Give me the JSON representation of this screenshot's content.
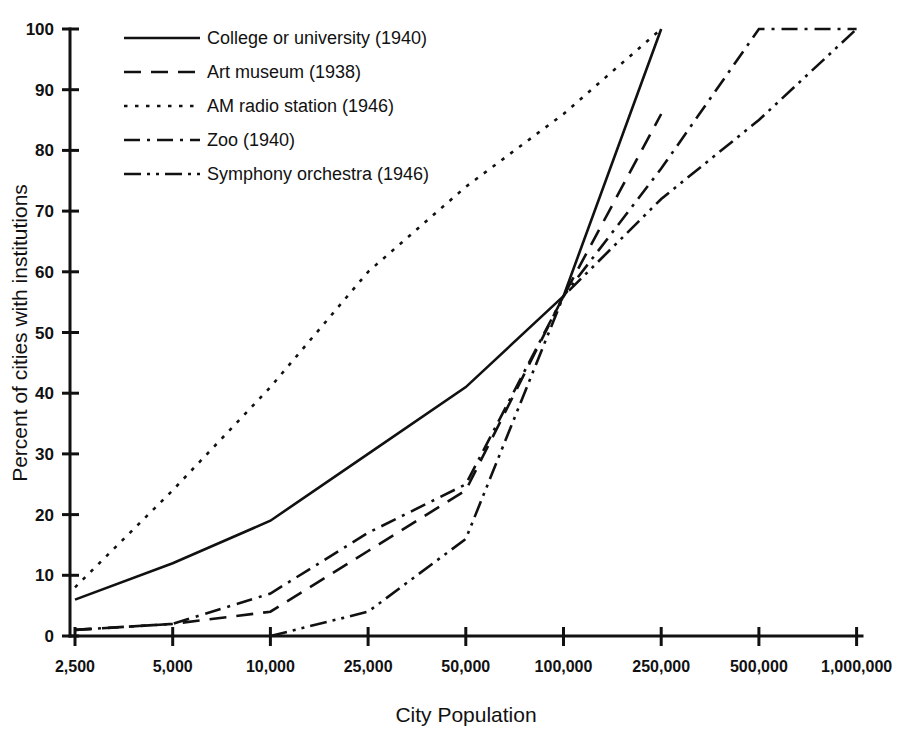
{
  "chart_data": {
    "type": "line",
    "title": "",
    "xlabel": "City Population",
    "ylabel": "Percent of cities with institutions",
    "categories": [
      "2,500",
      "5,000",
      "10,000",
      "25,000",
      "50,000",
      "100,000",
      "250,000",
      "500,000",
      "1,000,000"
    ],
    "x_tick_labels": [
      "2,500",
      "5,000",
      "10,000",
      "25,000",
      "50,000",
      "100,000",
      "250,000",
      "500,000",
      "1,000,000"
    ],
    "y_tick_labels": [
      "0",
      "10",
      "20",
      "30",
      "40",
      "50",
      "60",
      "70",
      "80",
      "90",
      "100"
    ],
    "ylim": [
      0,
      100
    ],
    "y_tick_step": 10,
    "grid": false,
    "legend_position": "top-left",
    "x_axis_scale": "categorical-log",
    "series": [
      {
        "name": "College or university (1940)",
        "legend_label": "College or university (1940)",
        "dash_style": "solid",
        "color": "#111111",
        "values": [
          6,
          12,
          19,
          30,
          41,
          56,
          100,
          null,
          null
        ]
      },
      {
        "name": "Art museum (1938)",
        "legend_label": "Art museum (1938)",
        "dash_style": "dashed",
        "color": "#111111",
        "values": [
          1,
          2,
          4,
          14,
          24,
          56,
          86,
          null,
          null
        ]
      },
      {
        "name": "AM radio station (1946)",
        "legend_label": "AM radio station (1946)",
        "dash_style": "dotted",
        "color": "#111111",
        "values": [
          8,
          24,
          41,
          60,
          74,
          86,
          100,
          null,
          null
        ]
      },
      {
        "name": "Zoo (1940)",
        "legend_label": "Zoo (1940)",
        "dash_style": "dashdot",
        "color": "#111111",
        "values": [
          1,
          2,
          7,
          17,
          25,
          56,
          77,
          100,
          100
        ]
      },
      {
        "name": "Symphony orchestra (1946)",
        "legend_label": "Symphony orchestra (1946)",
        "dash_style": "dashdotdot",
        "color": "#111111",
        "values": [
          null,
          null,
          0,
          4,
          16,
          56,
          72,
          85,
          100
        ]
      }
    ]
  },
  "legend": {
    "items": [
      {
        "label": "College or university (1940)"
      },
      {
        "label": "Art museum (1938)"
      },
      {
        "label": "AM radio station (1946)"
      },
      {
        "label": "Zoo (1940)"
      },
      {
        "label": "Symphony orchestra (1946)"
      }
    ]
  }
}
